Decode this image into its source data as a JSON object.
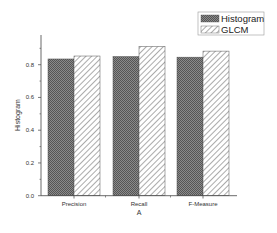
{
  "chart_data": {
    "type": "bar",
    "title": "",
    "xlabel": "A",
    "ylabel": "Histogram",
    "categories": [
      "Precision",
      "Recall",
      "F-Measure"
    ],
    "series": [
      {
        "name": "Histogram",
        "values": [
          0.835,
          0.85,
          0.846
        ],
        "pattern": "crosshatch-dark",
        "color": "#6e6e6e"
      },
      {
        "name": "GLCM",
        "values": [
          0.853,
          0.911,
          0.883
        ],
        "pattern": "diagonal-hatch",
        "color": "#ffffff"
      }
    ],
    "yticks": [
      "0.0",
      "0.2",
      "0.4",
      "0.6",
      "0.8"
    ],
    "ylim": [
      0,
      0.98
    ],
    "grid": false,
    "legend_position": "top-right"
  }
}
